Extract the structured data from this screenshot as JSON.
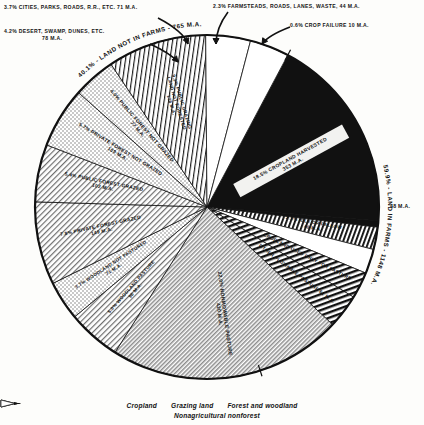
{
  "chart_data": {
    "type": "pie",
    "title": "",
    "total_label": "M.A.",
    "cx": 207,
    "cy": 207,
    "r": 172,
    "start_angle_deg": -62,
    "slices": [
      {
        "key": "cropland_harvested",
        "percent": 18.5,
        "label": "18.5% CROPLAND HARVESTED",
        "value_label": "353 M.A.",
        "value": 353,
        "group": "Cropland",
        "fill": "black",
        "text_color": "light"
      },
      {
        "key": "crop_failure",
        "percent": 0.6,
        "label": "0.6% CROP FAILURE",
        "value_label": "10 M.A.",
        "value": 10,
        "group": "Cropland",
        "fill": "black",
        "text_color": "light"
      },
      {
        "key": "idle_or_fallow",
        "percent": 2.1,
        "label": "2.1% IDLE OR FALLOW",
        "value_label": "40 M.A.",
        "value": 40,
        "group": "Cropland",
        "fill": "stripe-v",
        "text_color": "dark"
      },
      {
        "key": "farmsteads_roads",
        "percent": 2.3,
        "label": "2.3% FARMSTEADS, ROADS, LANES, WASTE,",
        "value_label": "44 M.A.",
        "value": 44,
        "group": "Nonagricultural nonforest",
        "fill": "white",
        "text_color": "dark"
      },
      {
        "key": "cropland_used_only_for_pasture",
        "percent": 2.5,
        "label": "CROPLAND USED ONLY FOR PASTURE",
        "value_label": "48 M.A.",
        "value": 48,
        "group": "Grazing land",
        "fill": "stripe-bold",
        "text_color": "dark"
      },
      {
        "key": "other_plowable_pasture",
        "percent": 3.2,
        "label": "OTHER PLOWABLE PASTURE",
        "value_label": "61 M.A.",
        "value": 61,
        "group": "Grazing land",
        "fill": "stripe-bold",
        "text_color": "dark"
      },
      {
        "key": "nonmowable_pasture",
        "percent": 22.0,
        "label": "22.0% NONMOWABLE PASTURE",
        "value_label": "420 M.A.",
        "value": 420,
        "group": "Grazing land",
        "fill": "hatch-fine",
        "text_color": "dark"
      },
      {
        "key": "woodland_pasture",
        "percent": 5.0,
        "label": "5.0% WOODLAND PASTURE",
        "value_label": "96 M.A.",
        "value": 96,
        "group": "Forest and woodland",
        "fill": "hatch-med",
        "text_color": "dark"
      },
      {
        "key": "woodland_not_pastured",
        "percent": 3.7,
        "label": "3.7% WOODLAND NOT PASTURED",
        "value_label": "71 M.A.",
        "value": 71,
        "group": "Forest and woodland",
        "fill": "dots",
        "text_color": "dark"
      },
      {
        "key": "private_forest_grazed",
        "percent": 7.8,
        "label": "7.8% PRIVATE FOREST GRAZED",
        "value_label": "149 M.A.",
        "value": 149,
        "group": "Forest and woodland",
        "fill": "hatch-med",
        "text_color": "dark"
      },
      {
        "key": "public_forest_grazed",
        "percent": 5.4,
        "label": "5.4% PUBLIC FOREST GRAZED",
        "value_label": "102 M.A.",
        "value": 102,
        "group": "Forest and woodland",
        "fill": "hatch-med",
        "text_color": "dark"
      },
      {
        "key": "private_forest_not_grazed",
        "percent": 5.7,
        "label": "5.7% PRIVATE FOREST NOT GRAZED",
        "value_label": "109 M.A.",
        "value": 109,
        "group": "Forest and woodland",
        "fill": "dots",
        "text_color": "dark"
      },
      {
        "key": "public_forest_not_grazed",
        "percent": 4.0,
        "label": "4.0% PUBLIC FOREST NOT GRAZED",
        "value_label": "77 M.A.",
        "value": 77,
        "group": "Forest and woodland",
        "fill": "dots",
        "text_color": "dark"
      },
      {
        "key": "public_grazing_not_forested",
        "percent": 9.3,
        "label": "9.3% PUBLIC GRAZING LAND NOT FORESTED",
        "value_label": "178 M.A.",
        "value": 178,
        "group": "Grazing land",
        "fill": "line-v",
        "text_color": "dark"
      },
      {
        "key": "desert_swamp_dunes",
        "percent": 4.2,
        "label": "4.2% DESERT, SWAMP, DUNES, ETC.",
        "value_label": "78 M.A.",
        "value": 78,
        "group": "Nonagricultural nonforest",
        "fill": "white",
        "text_color": "dark"
      },
      {
        "key": "cities_parks_roads",
        "percent": 3.7,
        "label": "3.7% CITIES, PARKS, ROADS, R.R., ETC.",
        "value_label": "71 M.A.",
        "value": 71,
        "group": "Nonagricultural nonforest",
        "fill": "white",
        "text_color": "dark"
      }
    ],
    "arcs": [
      {
        "key": "land_in_farms",
        "label": "59.9% - LAND IN FARMS - 1148 M.A.",
        "percent": 59.9,
        "value": 1148
      },
      {
        "key": "land_not_in_farms",
        "label": "40.1% - LAND NOT IN FARMS - 765 M.A.",
        "percent": 40.1,
        "value": 765
      }
    ]
  },
  "callouts": {
    "cities": "3.7% CITIES, PARKS, ROADS, R.R., ETC. 71 M.A.",
    "desert_l1": "4.2% DESERT, SWAMP, DUNES, ETC.",
    "desert_l2": "78 M.A.",
    "farmsteads": "2.3% FARMSTEADS, ROADS, LANES, WASTE, 44 M.A.",
    "crop_failure": "0.6% CROP FAILURE  10 M.A.",
    "edge_48": "48 M.A."
  },
  "arc_labels": {
    "land_not_in_farms": "40.1% - LAND NOT IN FARMS - 765 M.A.",
    "land_in_farms": "59.9% - LAND IN FARMS - 1148 M.A."
  },
  "inner_labels": {
    "cropland_harvested_l1": "18.5% CROPLAND HARVESTED",
    "cropland_harvested_l2": "353 M.A.",
    "idle_or_fallow_l1": "2.1% IDLE OR FALLOW",
    "idle_or_fallow_l2": "40 M.A.",
    "cropland_used_only_pasture": "CROPLAND USED ONLY FOR PASTURE",
    "other_plowable_pasture": "OTHER PLOWABLE PASTURE 61 M.A.",
    "nonmowable_l1": "22.0% NONMOWABLE PASTURE",
    "nonmowable_l2": "420 M.A.",
    "woodland_pasture_l1": "5.0% WOODLAND PASTURE",
    "woodland_pasture_l2": "96 M.A.",
    "woodland_not_pastured_l1": "3.7% WOODLAND NOT PASTURED",
    "woodland_not_pastured_l2": "71 M.A.",
    "private_forest_grazed_l1": "7.8% PRIVATE FOREST GRAZED",
    "private_forest_grazed_l2": "149 M.A.",
    "public_forest_grazed_l1": "5.4% PUBLIC FOREST GRAZED",
    "public_forest_grazed_l2": "102 M.A.",
    "private_forest_not_grazed_l1": "5.7% PRIVATE FOREST NOT GRAZED",
    "private_forest_not_grazed_l2": "109 M.A.",
    "public_forest_not_grazed_l1": "4.0% PUBLIC FOREST NOT GRAZED",
    "public_forest_not_grazed_l2": "77 M.A.",
    "public_grazing_l1": "9.3% PUBLIC GRAZING",
    "public_grazing_l2": "LAND NOT FORESTED",
    "public_grazing_l3": "178 M.A."
  },
  "legend": {
    "items": [
      {
        "key": "cropland",
        "label": "Cropland",
        "swatch": "solid-black"
      },
      {
        "key": "grazing",
        "label": "Grazing land",
        "swatch": "hatched"
      },
      {
        "key": "forest",
        "label": "Forest and woodland",
        "swatch": "dotted"
      },
      {
        "key": "nonag",
        "label": "Nonagricultural nonforest",
        "swatch": "empty"
      }
    ]
  }
}
